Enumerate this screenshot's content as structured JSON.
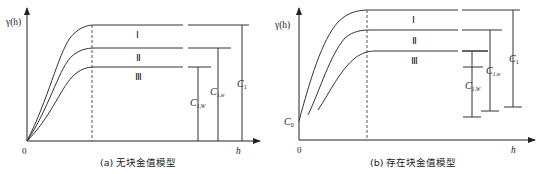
{
  "figure": {
    "panel_a": {
      "caption": "(a) 无块金值模型",
      "y_axis_label": "γ(h)",
      "x_axis_label": "h",
      "origin_label": "0",
      "curve_labels": [
        "Ⅰ",
        "Ⅱ",
        "Ⅲ"
      ],
      "sill_labels": {
        "c1": "C",
        "c1_sub": "1",
        "c1w": "C",
        "c1w_sub": "1,w",
        "c1W": "C",
        "c1W_sub": "1,W"
      }
    },
    "panel_b": {
      "caption": "(b) 存在块金值模型",
      "y_axis_label": "γ(h)",
      "x_axis_label": "h",
      "origin_label": "0",
      "nugget_label": "C",
      "nugget_sub": "0",
      "curve_labels": [
        "Ⅰ",
        "Ⅱ",
        "Ⅲ"
      ],
      "sill_labels": {
        "c1": "C",
        "c1_sub": "1",
        "c1w": "C",
        "c1w_sub": "1,w",
        "c1W": "C",
        "c1W_sub": "1,W"
      }
    }
  }
}
